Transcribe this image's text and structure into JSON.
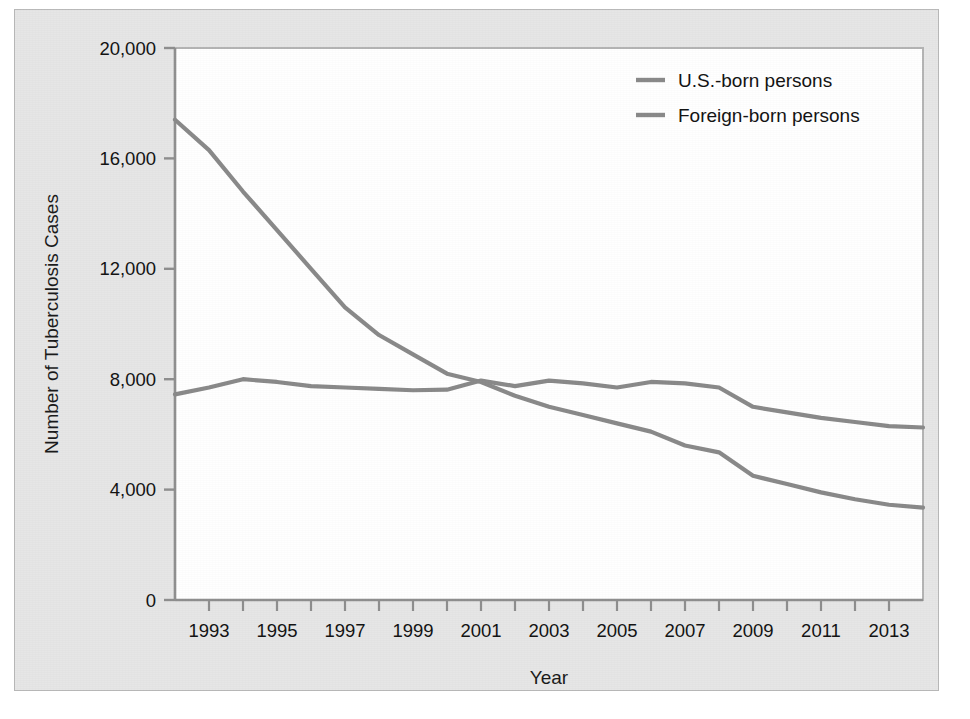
{
  "figure": {
    "panel_bg": "#e6e6e6",
    "plot_bg": "#ffffff",
    "line_color": "#8a8a8a",
    "axis_color": "#8f8f8f",
    "text_color": "#141414"
  },
  "chart_data": {
    "type": "line",
    "title": "",
    "subtitle": "",
    "xlabel": "Year",
    "ylabel": "Number of Tuberculosis Cases",
    "x": [
      1992,
      1993,
      1994,
      1995,
      1996,
      1997,
      1998,
      1999,
      2000,
      2001,
      2002,
      2003,
      2004,
      2005,
      2006,
      2007,
      2008,
      2009,
      2010,
      2011,
      2012,
      2013,
      2014
    ],
    "xtick_labels": [
      "1993",
      "1995",
      "1997",
      "1999",
      "2001",
      "2003",
      "2005",
      "2007",
      "2009",
      "2011",
      "2013"
    ],
    "xtick_values": [
      1993,
      1995,
      1997,
      1999,
      2001,
      2003,
      2005,
      2007,
      2009,
      2011,
      2013
    ],
    "xlim": [
      1992,
      2014
    ],
    "ytick_labels": [
      "0",
      "4,000",
      "8,000",
      "12,000",
      "16,000",
      "20,000"
    ],
    "ytick_values": [
      0,
      4000,
      8000,
      12000,
      16000,
      20000
    ],
    "ylim": [
      0,
      20000
    ],
    "grid": false,
    "legend_position": "top-right",
    "series": [
      {
        "name": "U.S.-born persons",
        "color": "#8a8a8a",
        "values": [
          17400,
          16300,
          14800,
          13400,
          12000,
          10600,
          9600,
          8900,
          8200,
          7900,
          7400,
          7000,
          6700,
          6400,
          6100,
          5600,
          5350,
          4500,
          4200,
          3900,
          3650,
          3450,
          3350
        ]
      },
      {
        "name": "Foreign-born persons",
        "color": "#8a8a8a",
        "values": [
          7450,
          7700,
          8000,
          7900,
          7750,
          7700,
          7650,
          7600,
          7620,
          7950,
          7750,
          7950,
          7850,
          7700,
          7900,
          7850,
          7700,
          7000,
          6800,
          6600,
          6450,
          6300,
          6250
        ]
      }
    ],
    "annotations": []
  },
  "legend": {
    "items": [
      {
        "label": "U.S.-born persons",
        "swatch": "line-swatch"
      },
      {
        "label": "Foreign-born persons",
        "swatch": "line-swatch"
      }
    ]
  }
}
